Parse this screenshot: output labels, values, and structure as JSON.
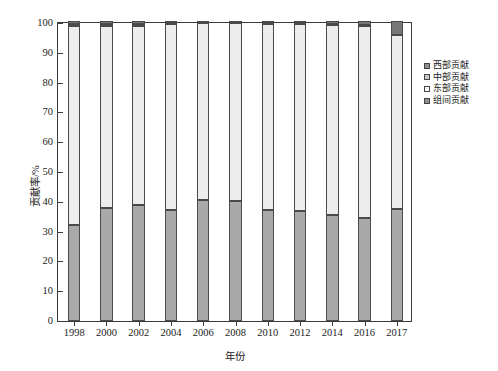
{
  "chart_data": {
    "type": "bar",
    "subtype": "stacked-bar-100",
    "title": "",
    "xlabel": "年份",
    "ylabel": "贡献率/%",
    "ylim": [
      0,
      100
    ],
    "yticks": [
      0,
      10,
      20,
      30,
      40,
      50,
      60,
      70,
      80,
      90,
      100
    ],
    "grid": false,
    "legend_position": "right",
    "categories": [
      "1998",
      "2000",
      "2002",
      "2004",
      "2006",
      "2008",
      "2010",
      "2012",
      "2014",
      "2016",
      "2017"
    ],
    "series": [
      {
        "name": "西部贡献",
        "color": "#a9a9a9",
        "values": [
          32.1,
          37.8,
          38.8,
          37.0,
          40.5,
          40.0,
          37.1,
          36.8,
          35.4,
          34.4,
          37.5
        ]
      },
      {
        "name": "中部贡献",
        "color": "#ededed",
        "values": [
          66.3,
          60.6,
          59.5,
          62.0,
          58.8,
          59.3,
          62.0,
          62.3,
          63.3,
          63.8,
          57.8
        ]
      },
      {
        "name": "东部贡献",
        "color": "#fafafa",
        "values": [
          0.5,
          0.5,
          0.6,
          0.3,
          0.2,
          0.2,
          0.3,
          0.3,
          0.4,
          0.6,
          0.2
        ]
      },
      {
        "name": "组间贡献",
        "color": "#777777",
        "values": [
          1.1,
          1.1,
          1.1,
          0.7,
          0.5,
          0.5,
          0.6,
          0.6,
          0.9,
          1.2,
          4.5
        ]
      }
    ]
  },
  "legend": {
    "items": [
      {
        "label": "西部贡献",
        "color": "#8f8f8f"
      },
      {
        "label": "中部贡献",
        "color": "#c9c9c9"
      },
      {
        "label": "东部贡献",
        "color": "#fbfbfb"
      },
      {
        "label": "组间贡献",
        "color": "#8f8f8f"
      }
    ]
  },
  "axes": {
    "y_label": "贡献率/%",
    "x_label": "年份",
    "y_ticks": [
      "0",
      "10",
      "20",
      "30",
      "40",
      "50",
      "60",
      "70",
      "80",
      "90",
      "100"
    ],
    "x_ticks": [
      "1998",
      "2000",
      "2002",
      "2004",
      "2006",
      "2008",
      "2010",
      "2012",
      "2014",
      "2016",
      "2017"
    ]
  }
}
